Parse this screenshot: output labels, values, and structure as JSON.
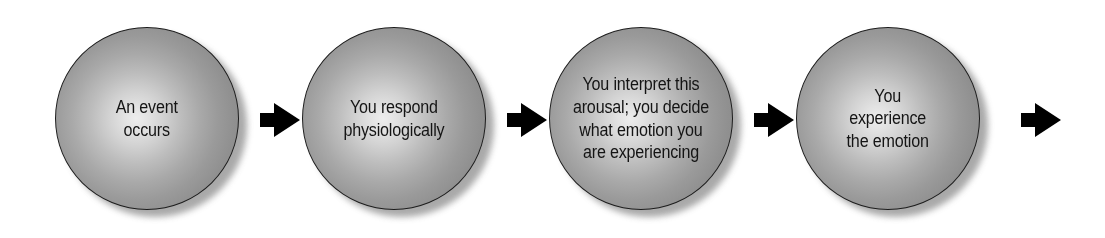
{
  "diagram": {
    "background_color": "#ffffff",
    "arrow_color": "#000000",
    "sphere_highlight_color": "#ededed",
    "sphere_edge_color": "#878787",
    "sphere_outline_color": "#1c1c1c",
    "text_color": "#141414",
    "nodes": [
      {
        "id": "node-0",
        "name": "event-occurs",
        "lines": [
          "An event",
          "occurs"
        ],
        "text": "An event occurs"
      },
      {
        "id": "node-1",
        "name": "respond-physiologically",
        "lines": [
          "You respond",
          "physiologically"
        ],
        "text": "You respond physiologically"
      },
      {
        "id": "node-2",
        "name": "interpret-arousal",
        "lines": [
          "You interpret this",
          "arousal; you decide",
          "what emotion you",
          "are experiencing"
        ],
        "text": "You interpret this arousal; you decide what emotion you are experiencing"
      },
      {
        "id": "node-3",
        "name": "experience-emotion",
        "lines": [
          "You",
          "experience",
          "the emotion"
        ],
        "text": "You experience the emotion"
      }
    ],
    "arrows": [
      {
        "id": "arrow-0",
        "name": "arrow-right-icon",
        "direction": "right"
      },
      {
        "id": "arrow-1",
        "name": "arrow-right-icon",
        "direction": "right"
      },
      {
        "id": "arrow-2",
        "name": "arrow-right-icon",
        "direction": "right"
      },
      {
        "id": "arrow-3",
        "name": "arrow-right-icon",
        "direction": "right"
      }
    ]
  }
}
